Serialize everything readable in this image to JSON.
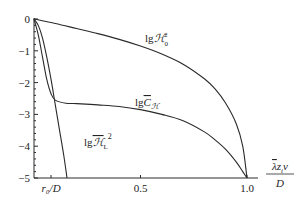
{
  "chart_data": {
    "type": "line",
    "title": "",
    "xlabel": "λ̄ z_i v / D",
    "xlabel_parts": {
      "numerator": "λ̄zᵢv",
      "denominator": "D"
    },
    "ylabel": "",
    "xlim": [
      0,
      1.0
    ],
    "ylim": [
      -5,
      0
    ],
    "grid": false,
    "x_ticks": [
      {
        "value": 0.08,
        "label": "r₀/D"
      },
      {
        "value": 0.5,
        "label": "0.5"
      },
      {
        "value": 1.0,
        "label": "1.0"
      }
    ],
    "y_ticks": [
      {
        "value": 0,
        "label": "0"
      },
      {
        "value": -1,
        "label": "−1"
      },
      {
        "value": -2,
        "label": "−2"
      },
      {
        "value": -3,
        "label": "−3"
      },
      {
        "value": -4,
        "label": "−4"
      },
      {
        "value": -5,
        "label": "−5"
      }
    ],
    "series": [
      {
        "name": "lg H0^2",
        "label": "lgℋ",
        "label_sub": "0",
        "label_sup": "2",
        "x": [
          0.0,
          0.1,
          0.2,
          0.3,
          0.4,
          0.5,
          0.6,
          0.7,
          0.8,
          0.85,
          0.9,
          0.95,
          0.98,
          1.0
        ],
        "y": [
          0.0,
          -0.14,
          -0.3,
          -0.46,
          -0.64,
          -0.85,
          -1.1,
          -1.42,
          -1.88,
          -2.2,
          -2.65,
          -3.3,
          -4.0,
          -5.0
        ]
      },
      {
        "name": "lg C_H",
        "label": "lgC̅",
        "label_sub": "ℋ",
        "x": [
          0.0,
          0.02,
          0.04,
          0.06,
          0.08,
          0.1,
          0.15,
          0.2,
          0.3,
          0.4,
          0.5,
          0.6,
          0.7,
          0.8,
          0.85,
          0.9,
          0.95,
          0.98,
          1.0
        ],
        "y": [
          0.0,
          -0.5,
          -1.2,
          -1.9,
          -2.35,
          -2.55,
          -2.65,
          -2.66,
          -2.7,
          -2.75,
          -2.85,
          -3.0,
          -3.2,
          -3.55,
          -3.8,
          -4.1,
          -4.5,
          -4.8,
          -5.0
        ],
        "note": "x=1.0 endpoint approaches -5"
      },
      {
        "name": "lg H_L^2",
        "label": "lgℋ̅",
        "label_sub": "L",
        "label_sup": "2",
        "x": [
          0.0,
          0.02,
          0.04,
          0.06,
          0.08,
          0.1,
          0.12,
          0.14,
          0.155
        ],
        "y": [
          0.0,
          -0.2,
          -0.6,
          -1.2,
          -1.9,
          -2.7,
          -3.5,
          -4.3,
          -5.0
        ]
      }
    ],
    "annotations": [
      {
        "text": "lgℋ₀²",
        "at_series": "lg H0^2"
      },
      {
        "text": "lgC̅ℋ",
        "at_series": "lg C_H"
      },
      {
        "text": "lgℋ̅L²",
        "at_series": "lg H_L^2"
      }
    ]
  }
}
